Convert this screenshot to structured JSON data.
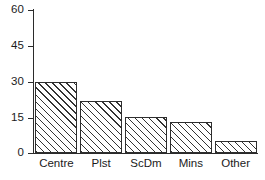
{
  "chart_data": {
    "type": "bar",
    "title": "",
    "subtitle": "",
    "xlabel": "",
    "ylabel": "",
    "categories": [
      "Centre",
      "Plst",
      "ScDm",
      "Mins",
      "Other"
    ],
    "values": [
      30,
      22,
      15,
      13,
      5
    ],
    "ylim": [
      0,
      60
    ],
    "yticks": [
      0,
      15,
      30,
      45,
      60
    ],
    "ytick_labels": [
      "0",
      "15",
      "30",
      "45",
      "60"
    ],
    "grid": false,
    "legend": null,
    "bar_style": {
      "fill": "diagonal-hatch",
      "hatch_angle_deg": 45,
      "edge_color": "#2e2e2e",
      "face_color": "#ffffff",
      "hatch_color": "#333333"
    },
    "axis_color": "#2b2b2b",
    "background_color": "#ffffff"
  }
}
